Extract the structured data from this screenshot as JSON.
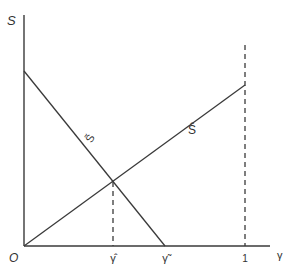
{
  "diagram": {
    "colors": {
      "line": "#3a3a3a",
      "text": "#333333",
      "background": "#ffffff"
    },
    "axes": {
      "y_label": "S",
      "x_label": "γ",
      "origin_label": "O"
    },
    "curves": [
      {
        "name": "S-tilde",
        "label": "S̃",
        "description": "downward sloping line from S-axis to γ̃ on x-axis"
      },
      {
        "name": "S-hat",
        "label": "Ŝ",
        "description": "upward sloping line from origin to x = 1"
      }
    ],
    "x_ticks": [
      {
        "name": "gamma-hat",
        "label": "γ̂"
      },
      {
        "name": "gamma-tilde",
        "label": "γ̃"
      },
      {
        "name": "one",
        "label": "1"
      }
    ],
    "dashed_lines": [
      {
        "name": "gamma-hat-guide",
        "at": "γ̂"
      },
      {
        "name": "one-guide",
        "at": "1"
      }
    ]
  }
}
